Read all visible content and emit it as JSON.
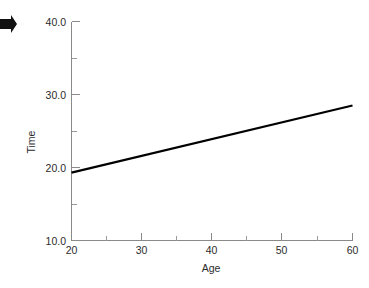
{
  "chart_data": {
    "type": "line",
    "title": "",
    "subtitle": "",
    "xlabel": "Age",
    "ylabel": "Time",
    "xlim": [
      20,
      60
    ],
    "ylim": [
      10.0,
      40.0
    ],
    "grid": false,
    "legend": null,
    "x_major_ticks": [
      20,
      30,
      40,
      50,
      60
    ],
    "x_major_tick_labels": [
      "20",
      "30",
      "40",
      "50",
      "60"
    ],
    "x_minor_ticks": [
      25,
      35,
      45,
      55
    ],
    "y_major_ticks": [
      10.0,
      20.0,
      30.0,
      40.0
    ],
    "y_major_tick_labels": [
      "10.0",
      "20.0",
      "30.0",
      "40.0"
    ],
    "y_minor_ticks": [
      15.0,
      25.0,
      35.0
    ],
    "series": [
      {
        "name": "fitted-line",
        "style": "solid",
        "color": "#000000",
        "x": [
          20,
          60
        ],
        "values": [
          19.3,
          28.5
        ]
      }
    ],
    "annotations": [
      {
        "name": "left-edge-arrow-marker",
        "text": "",
        "x_px": 8,
        "y_px": 24
      }
    ]
  },
  "colors": {
    "background": "#ffffff",
    "axis": "#8a8a8a",
    "line": "#000000",
    "text": "#2b2b2b"
  }
}
